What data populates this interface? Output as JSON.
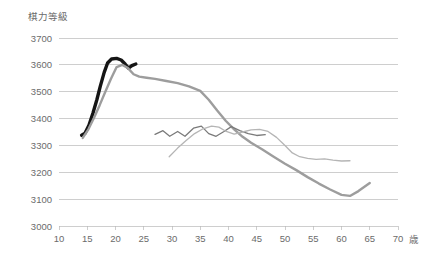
{
  "chart_data": {
    "type": "line",
    "title": "",
    "ylabel": "棋力等級",
    "xlabel": "歳",
    "xlim": [
      10,
      70
    ],
    "ylim": [
      3000,
      3700
    ],
    "x_ticks": [
      10,
      15,
      20,
      25,
      30,
      35,
      40,
      45,
      50,
      55,
      60,
      65,
      70
    ],
    "y_ticks": [
      3000,
      3100,
      3200,
      3300,
      3400,
      3500,
      3600,
      3700
    ],
    "grid": true,
    "legend": "none",
    "series": [
      {
        "name": "thick-black-line",
        "color": "#151515",
        "width": 3.4,
        "points": [
          [
            14.0,
            3338
          ],
          [
            14.6,
            3345
          ],
          [
            15.3,
            3375
          ],
          [
            16.0,
            3420
          ],
          [
            16.7,
            3470
          ],
          [
            17.3,
            3520
          ],
          [
            18.0,
            3572
          ],
          [
            18.6,
            3607
          ],
          [
            19.3,
            3622
          ],
          [
            20.2,
            3624
          ],
          [
            21.0,
            3618
          ],
          [
            21.7,
            3603
          ],
          [
            22.3,
            3588
          ],
          [
            22.9,
            3597
          ],
          [
            23.6,
            3603
          ]
        ]
      },
      {
        "name": "thick-gray-line",
        "color": "#9d9d9d",
        "width": 2.4,
        "points": [
          [
            14.2,
            3328
          ],
          [
            15.2,
            3360
          ],
          [
            16.2,
            3403
          ],
          [
            17.2,
            3450
          ],
          [
            18.2,
            3500
          ],
          [
            19.2,
            3548
          ],
          [
            20.2,
            3592
          ],
          [
            21.2,
            3600
          ],
          [
            22.2,
            3588
          ],
          [
            23.2,
            3565
          ],
          [
            24.2,
            3556
          ],
          [
            25.5,
            3552
          ],
          [
            27.0,
            3548
          ],
          [
            29.0,
            3540
          ],
          [
            31.0,
            3532
          ],
          [
            33.0,
            3520
          ],
          [
            35.0,
            3503
          ],
          [
            36.5,
            3470
          ],
          [
            38.0,
            3430
          ],
          [
            39.5,
            3392
          ],
          [
            41.0,
            3360
          ],
          [
            42.5,
            3332
          ],
          [
            44.0,
            3310
          ],
          [
            46.0,
            3285
          ],
          [
            48.0,
            3258
          ],
          [
            50.0,
            3232
          ],
          [
            52.0,
            3208
          ],
          [
            54.0,
            3182
          ],
          [
            56.0,
            3158
          ],
          [
            58.0,
            3136
          ],
          [
            60.0,
            3116
          ],
          [
            61.5,
            3112
          ],
          [
            63.0,
            3130
          ],
          [
            65.0,
            3160
          ]
        ]
      },
      {
        "name": "medium-gray-jagged-line",
        "color": "#7a7a7a",
        "width": 1.3,
        "points": [
          [
            27.0,
            3341
          ],
          [
            28.4,
            3355
          ],
          [
            29.6,
            3334
          ],
          [
            31.0,
            3352
          ],
          [
            32.3,
            3334
          ],
          [
            33.8,
            3364
          ],
          [
            35.2,
            3372
          ],
          [
            36.5,
            3344
          ],
          [
            37.8,
            3334
          ],
          [
            39.2,
            3352
          ],
          [
            40.5,
            3370
          ],
          [
            42.0,
            3355
          ],
          [
            43.5,
            3344
          ],
          [
            45.0,
            3337
          ],
          [
            46.5,
            3340
          ]
        ]
      },
      {
        "name": "light-gray-descending-line",
        "color": "#b5b5b5",
        "width": 1.3,
        "points": [
          [
            29.5,
            3258
          ],
          [
            31.0,
            3290
          ],
          [
            32.5,
            3318
          ],
          [
            34.0,
            3344
          ],
          [
            35.5,
            3362
          ],
          [
            37.0,
            3372
          ],
          [
            38.3,
            3368
          ],
          [
            39.6,
            3352
          ],
          [
            41.0,
            3342
          ],
          [
            42.5,
            3350
          ],
          [
            44.0,
            3358
          ],
          [
            45.5,
            3360
          ],
          [
            47.0,
            3352
          ],
          [
            48.5,
            3330
          ],
          [
            50.0,
            3300
          ],
          [
            51.3,
            3272
          ],
          [
            52.6,
            3258
          ],
          [
            54.0,
            3252
          ],
          [
            55.5,
            3248
          ],
          [
            57.0,
            3250
          ],
          [
            58.5,
            3245
          ],
          [
            60.0,
            3242
          ],
          [
            61.5,
            3243
          ]
        ]
      }
    ]
  },
  "axes": {
    "y_title": "棋力等級",
    "x_unit": "歳",
    "y_tick_labels": [
      "3700",
      "3600",
      "3500",
      "3400",
      "3300",
      "3200",
      "3100",
      "3000"
    ],
    "x_tick_labels": [
      "10",
      "15",
      "20",
      "25",
      "30",
      "35",
      "40",
      "45",
      "50",
      "55",
      "60",
      "65",
      "70"
    ]
  },
  "style": {
    "background": "#ffffff",
    "grid_color": "#b9b9b9",
    "text_color": "#6b6b6b"
  }
}
